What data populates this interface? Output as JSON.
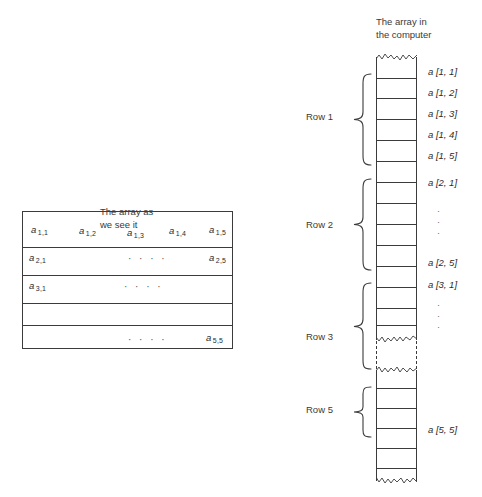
{
  "figure": {
    "left_panel": {
      "caption_line1": "The array as",
      "caption_line2": "we see it",
      "table": {
        "rows": 5,
        "cols": 5,
        "visible_cells": [
          {
            "label": "a",
            "sub": "1,1",
            "row": 1,
            "col": 1
          },
          {
            "label": "a",
            "sub": "1,2",
            "row": 1,
            "col": 2
          },
          {
            "label": "a",
            "sub": "1,3",
            "row": 1,
            "col": 3
          },
          {
            "label": "a",
            "sub": "1,4",
            "row": 1,
            "col": 4
          },
          {
            "label": "a",
            "sub": "1,5",
            "row": 1,
            "col": 5
          },
          {
            "label": "a",
            "sub": "2,1",
            "row": 2,
            "col": 1
          },
          {
            "label": "a",
            "sub": "2,5",
            "row": 2,
            "col": 5
          },
          {
            "label": "a",
            "sub": "3,1",
            "row": 3,
            "col": 1
          },
          {
            "label": "a",
            "sub": "5,5",
            "row": 5,
            "col": 5
          }
        ],
        "ellipses": "· · · ·"
      }
    },
    "right_panel": {
      "caption_line1": "The array in",
      "caption_line2": "the computer",
      "row_braces": [
        {
          "label": "Row 1"
        },
        {
          "label": "Row 2"
        },
        {
          "label": "Row 3"
        },
        {
          "label": "Row 5"
        }
      ],
      "slot_labels": [
        "a [1, 1]",
        "a [1, 2]",
        "a [1, 3]",
        "a [1, 4]",
        "a [1, 5]",
        "a [2, 1]",
        "a [2, 5]",
        "a [3, 1]",
        "a [5, 5]"
      ],
      "vertical_ellipsis": "·\n·\n·"
    }
  },
  "colors": {
    "ink": "#3b3b3b",
    "text": "#2b2b2b",
    "paper": "#ffffff"
  }
}
